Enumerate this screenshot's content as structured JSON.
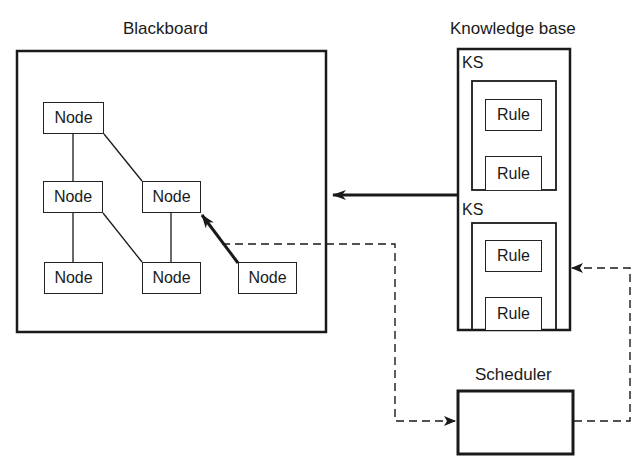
{
  "blackboard": {
    "title": "Blackboard",
    "nodes": [
      {
        "label": "Node"
      },
      {
        "label": "Node"
      },
      {
        "label": "Node"
      },
      {
        "label": "Node"
      },
      {
        "label": "Node"
      },
      {
        "label": "Node"
      }
    ]
  },
  "knowledge_base": {
    "title": "Knowledge base",
    "sources": [
      {
        "label": "KS",
        "rules": [
          {
            "label": "Rule"
          },
          {
            "label": "Rule"
          }
        ]
      },
      {
        "label": "KS",
        "rules": [
          {
            "label": "Rule"
          },
          {
            "label": "Rule"
          }
        ]
      }
    ]
  },
  "scheduler": {
    "title": "Scheduler"
  },
  "colors": {
    "line": "#1a1a1a",
    "background": "#ffffff"
  }
}
